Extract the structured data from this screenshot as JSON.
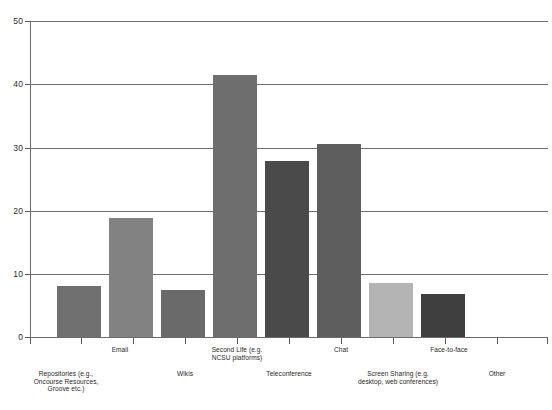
{
  "chart_data": {
    "type": "bar",
    "title": "",
    "subtitle": "",
    "xlabel": "",
    "ylabel": "",
    "ylim": [
      0,
      50
    ],
    "ytick_values": [
      0,
      10,
      20,
      30,
      40,
      50
    ],
    "ytick_labels": [
      "0",
      "10",
      "20",
      "30",
      "40",
      "50"
    ],
    "grid": "horizontal",
    "legend": "none",
    "categories": [
      "Repositories (e.g.,\nOncourse Resources,\nGroove etc.)",
      "Email",
      "Wikis",
      "Second Life (e.g.\nNCSU platforms)",
      "Teleconference",
      "Chat",
      "Screen Sharing (e.g.\ndesktop, web conferences)",
      "Face-to-face",
      "Other"
    ],
    "values": [
      8.1,
      18.8,
      7.4,
      41.4,
      27.9,
      30.5,
      8.6,
      6.8,
      0
    ],
    "bar_colors": [
      "#707070",
      "#828282",
      "#6a6a6a",
      "#6e6e6e",
      "#4a4a4a",
      "#5e5e5e",
      "#b4b4b4",
      "#3f3f3f",
      "#ffffff"
    ],
    "axis_color": "#6b6b6b",
    "grid_color": "#6e6e6e",
    "background": "#ffffff"
  }
}
